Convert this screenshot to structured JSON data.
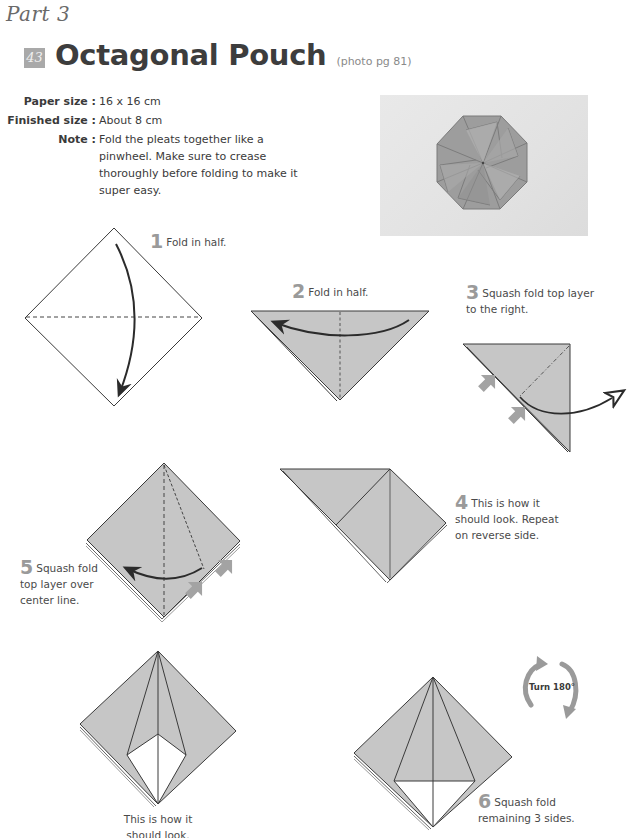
{
  "header": {
    "part_label": "Part 3",
    "model_number": "43",
    "title": "Octagonal Pouch",
    "photo_reference": "(photo pg 81)"
  },
  "specs": [
    {
      "label": "Paper size :",
      "value": "16 x 16 cm"
    },
    {
      "label": "Finished size :",
      "value": "About 8 cm"
    },
    {
      "label": "Note :",
      "value": "Fold the pleats together like a pinwheel. Make sure to crease thoroughly before folding to make it super easy."
    }
  ],
  "photo": {
    "alt": "Finished octagonal pouch photo"
  },
  "steps": [
    {
      "number": "1",
      "text": "Fold in half."
    },
    {
      "number": "2",
      "text": "Fold in half."
    },
    {
      "number": "3",
      "text": "Squash fold top layer to the right."
    },
    {
      "number": "4",
      "text": "This is how it should look. Repeat on reverse side."
    },
    {
      "number": "5",
      "text": "Squash fold top layer over center line."
    },
    {
      "number": "",
      "text": "This is how it should look."
    },
    {
      "number": "6",
      "text": "Squash fold remaining 3 sides."
    }
  ],
  "turn_icon": {
    "label": "Turn 180°"
  },
  "colors": {
    "paper_gray": "#c6c6c6",
    "line": "#333333",
    "push_arrow": "#a3a3a3",
    "badge": "#a9a9a9"
  }
}
